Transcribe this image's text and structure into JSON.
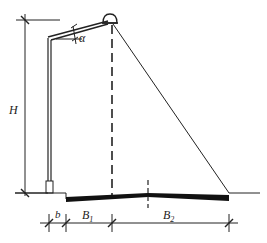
{
  "diagram": {
    "labels": {
      "height": "H",
      "angle": "α",
      "setback": "b",
      "b1_main": "B",
      "b1_sub": "1",
      "b2_main": "B",
      "b2_sub": "2"
    },
    "colors": {
      "line": "#222222",
      "background": "#ffffff"
    },
    "elements": [
      "height-dimension-line",
      "light-pole",
      "pole-arm",
      "luminaire",
      "light-cone-vertical-dashed",
      "light-cone-diagonal",
      "sidewalk-ground",
      "road-surface",
      "road-centerline",
      "bottom-dimension-line"
    ]
  }
}
